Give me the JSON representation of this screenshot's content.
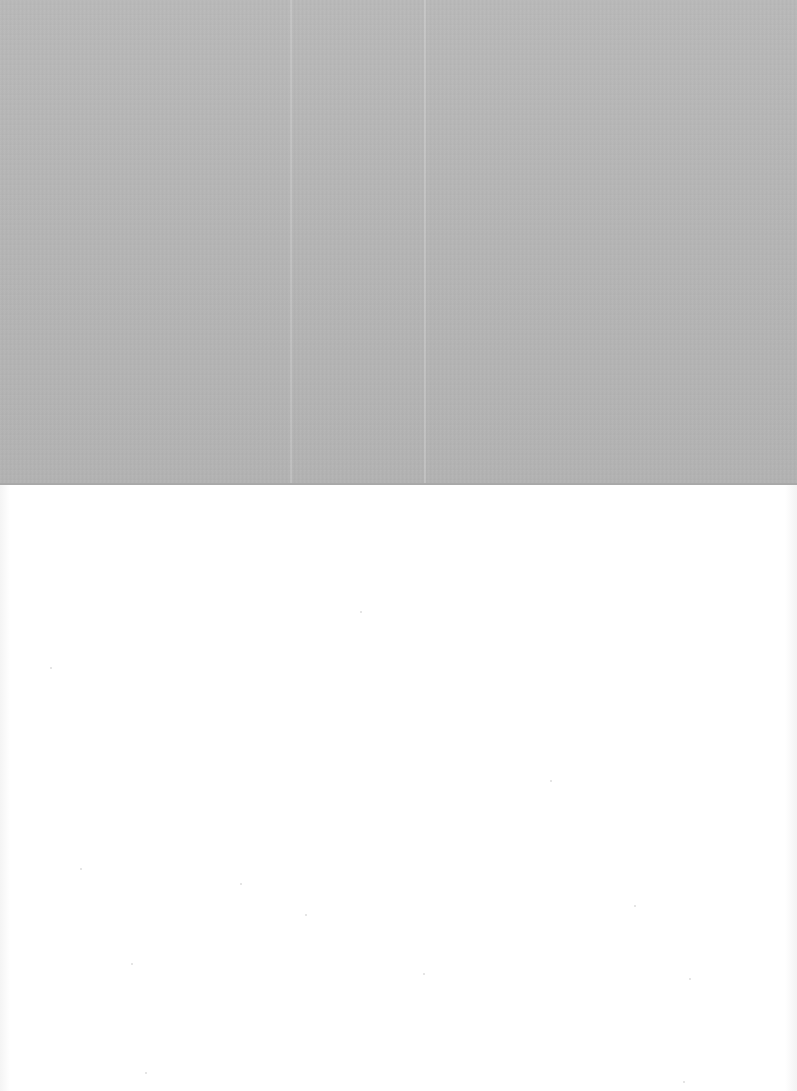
{
  "document": {
    "type": "scanned-page",
    "regions": [
      {
        "name": "gray-plate",
        "color": "#b6b6b6",
        "top": 0,
        "height": 485,
        "text": ""
      },
      {
        "name": "blank-area",
        "color": "#ffffff",
        "top": 485,
        "height": 606,
        "text": ""
      }
    ],
    "visible_text": ""
  },
  "colors": {
    "plate": "#b6b6b6",
    "paper": "#ffffff",
    "speck": "#dcdcdc"
  },
  "specks": [
    {
      "x": 50,
      "y": 667
    },
    {
      "x": 360,
      "y": 611
    },
    {
      "x": 80,
      "y": 868
    },
    {
      "x": 240,
      "y": 883
    },
    {
      "x": 305,
      "y": 914
    },
    {
      "x": 423,
      "y": 973
    },
    {
      "x": 634,
      "y": 905
    },
    {
      "x": 689,
      "y": 978
    },
    {
      "x": 131,
      "y": 963
    },
    {
      "x": 145,
      "y": 1072
    },
    {
      "x": 683,
      "y": 1081
    },
    {
      "x": 550,
      "y": 780
    }
  ]
}
